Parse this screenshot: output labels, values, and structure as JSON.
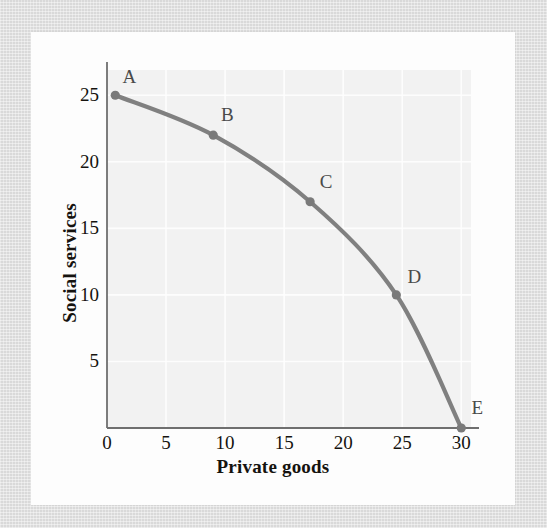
{
  "chart_data": {
    "type": "line",
    "title": "",
    "subtitle": "",
    "xlabel": "Private goods",
    "ylabel": "Social services",
    "xlim": [
      0,
      31.5
    ],
    "ylim": [
      0,
      27.5
    ],
    "xticks": [
      0,
      5,
      10,
      15,
      20,
      25,
      30
    ],
    "xticklabels": [
      "0",
      "5",
      "10",
      "15",
      "20",
      "25",
      "30"
    ],
    "yticks": [
      5,
      10,
      15,
      20,
      25
    ],
    "yticklabels": [
      "5",
      "10",
      "15",
      "20",
      "25"
    ],
    "grid": true,
    "legend": false,
    "series": [
      {
        "name": "Production possibilities frontier",
        "color": "#808080",
        "x": [
          0.7,
          9.0,
          17.2,
          24.5,
          30.0
        ],
        "y": [
          25.0,
          22.0,
          17.0,
          10.0,
          0.0
        ],
        "point_labels": [
          "A",
          "B",
          "C",
          "D",
          "E"
        ]
      }
    ],
    "points": [
      {
        "label": "A",
        "x": 0.7,
        "y": 25.0
      },
      {
        "label": "B",
        "x": 9.0,
        "y": 22.0
      },
      {
        "label": "C",
        "x": 17.2,
        "y": 17.0
      },
      {
        "label": "D",
        "x": 24.5,
        "y": 10.0
      },
      {
        "label": "E",
        "x": 30.0,
        "y": 0.0
      }
    ],
    "annotations": []
  },
  "colors": {
    "curve": "#808080",
    "marker": "#7a7a7a",
    "axis": "#6f6f6f",
    "plot_background": "#f2f2f2",
    "grid": "#ffffff",
    "text": "#15130f",
    "label_text": "#4a4a4a",
    "page_frame": "#d9d9d9",
    "paper": "#fdfdfd"
  }
}
